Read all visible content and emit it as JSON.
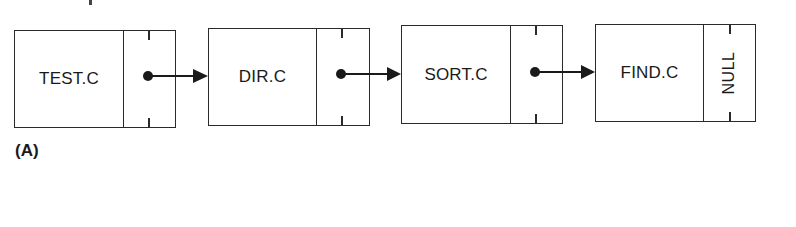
{
  "diagram": {
    "type": "singly-linked-list",
    "nodes": [
      {
        "label": "TEST.C",
        "next": "DIR.C"
      },
      {
        "label": "DIR.C",
        "next": "SORT.C"
      },
      {
        "label": "SORT.C",
        "next": "FIND.C"
      },
      {
        "label": "FIND.C",
        "next": "NULL"
      }
    ],
    "null_label": "NULL",
    "caption": "(A)",
    "colors": {
      "stroke": "#2a2a2a",
      "background": "#ffffff"
    }
  }
}
